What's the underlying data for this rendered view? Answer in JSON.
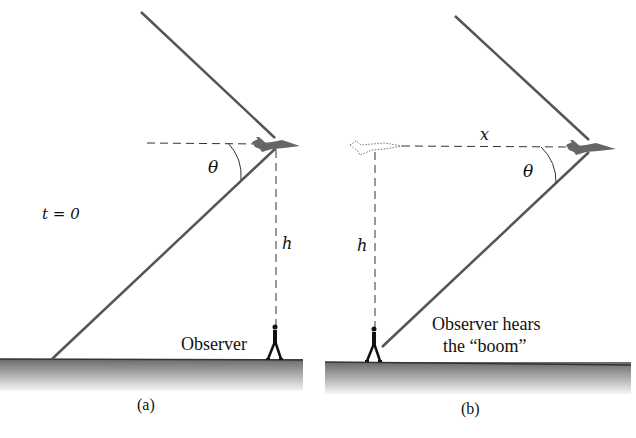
{
  "figure": {
    "panels": [
      {
        "id": "a",
        "caption": "(a)",
        "time_label": "t = 0",
        "angle_label": "θ",
        "height_label": "h",
        "observer_label": "Observer"
      },
      {
        "id": "b",
        "caption": "(b)",
        "distance_label": "x",
        "angle_label": "θ",
        "height_label": "h",
        "observer_label_line1": "Observer hears",
        "observer_label_line2": "the “boom”"
      }
    ],
    "colors": {
      "shock_line": "#555555",
      "dashed_line": "#333333",
      "ground_top": "#6a6a6a",
      "ground_bottom": "#f4f4f4",
      "aircraft": "#666666",
      "observer": "#111111"
    }
  }
}
